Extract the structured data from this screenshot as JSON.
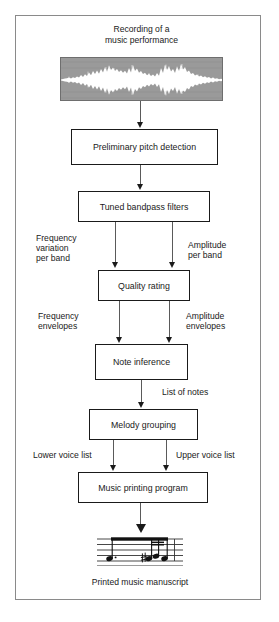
{
  "figure": {
    "title_line1": "Recording of a",
    "title_line2": "music performance",
    "caption": "Printed music manuscript"
  },
  "colors": {
    "frame_border": "#8a8a8a",
    "box_border": "#1a1a1a",
    "connector": "#5a5a5a",
    "arrowhead": "#1a1a1a",
    "waveform_background": "#9a9a9a",
    "waveform_trace": "#ffffff",
    "text": "#1a1a1a",
    "page_background": "#ffffff"
  },
  "nodes": [
    {
      "id": "recording",
      "label": "Recording of a\nmusic performance",
      "type": "caption"
    },
    {
      "id": "waveform",
      "label": "waveform-image",
      "type": "image"
    },
    {
      "id": "pitch-detection",
      "label": "Preliminary pitch detection",
      "type": "process"
    },
    {
      "id": "bandpass-filters",
      "label": "Tuned bandpass filters",
      "type": "process"
    },
    {
      "id": "quality-rating",
      "label": "Quality rating",
      "type": "process"
    },
    {
      "id": "note-inference",
      "label": "Note inference",
      "type": "process"
    },
    {
      "id": "melody-grouping",
      "label": "Melody grouping",
      "type": "process"
    },
    {
      "id": "music-printing",
      "label": "Music printing program",
      "type": "process"
    },
    {
      "id": "manuscript",
      "label": "Printed music manuscript",
      "type": "caption"
    }
  ],
  "boxes": {
    "pitch_detection": "Preliminary pitch detection",
    "bandpass_filters": "Tuned bandpass filters",
    "quality_rating": "Quality rating",
    "note_inference": "Note inference",
    "melody_grouping": "Melody grouping",
    "music_printing": "Music printing program"
  },
  "edge_labels": {
    "frequency_variation_l1": "Frequency",
    "frequency_variation_l2": "variation",
    "frequency_variation_l3": "per band",
    "amplitude_band_l1": "Amplitude",
    "amplitude_band_l2": "per band",
    "frequency_envelopes_l1": "Frequency",
    "frequency_envelopes_l2": "envelopes",
    "amplitude_envelopes_l1": "Amplitude",
    "amplitude_envelopes_l2": "envelopes",
    "list_of_notes": "List of notes",
    "lower_voice_list": "Lower voice list",
    "upper_voice_list": "Upper voice list"
  },
  "edges": [
    {
      "from": "waveform",
      "to": "pitch-detection",
      "label": ""
    },
    {
      "from": "pitch-detection",
      "to": "bandpass-filters",
      "label": ""
    },
    {
      "from": "bandpass-filters",
      "to": "quality-rating",
      "label": "Frequency variation per band"
    },
    {
      "from": "bandpass-filters",
      "to": "quality-rating",
      "label": "Amplitude per band"
    },
    {
      "from": "quality-rating",
      "to": "note-inference",
      "label": "Frequency envelopes"
    },
    {
      "from": "quality-rating",
      "to": "note-inference",
      "label": "Amplitude envelopes"
    },
    {
      "from": "note-inference",
      "to": "melody-grouping",
      "label": "List of notes"
    },
    {
      "from": "melody-grouping",
      "to": "music-printing",
      "label": "Lower voice list"
    },
    {
      "from": "melody-grouping",
      "to": "music-printing",
      "label": "Upper voice list"
    },
    {
      "from": "music-printing",
      "to": "manuscript",
      "label": ""
    }
  ]
}
